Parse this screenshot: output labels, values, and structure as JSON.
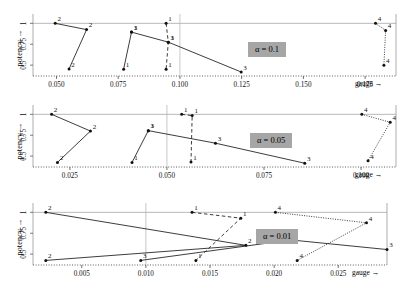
{
  "figure": {
    "y_axis_label": "potency →",
    "x_axis_label": "gauge →",
    "y_ticks": [
      "0.5",
      "0.75",
      "1"
    ],
    "y_tick_values": [
      0.5,
      0.75,
      1.0
    ],
    "ylim": [
      0.37,
      1.04
    ],
    "point_label_series": [
      "1",
      "2",
      "3",
      "4"
    ]
  },
  "panels": [
    {
      "id": "panel-alpha-0-1",
      "alpha_label": "α = 0.1",
      "x_ticks": [
        "0.050",
        "0.075",
        "0.100",
        "0.125",
        "0.150",
        "0.175"
      ],
      "x_tick_values": [
        0.05,
        0.075,
        0.1,
        0.125,
        0.15,
        0.175
      ],
      "xlim": [
        0.0405,
        0.1875
      ],
      "vline": 0.1,
      "chart_data": {
        "type": "line",
        "title": "α = 0.1",
        "xlabel": "gauge →",
        "ylabel": "potency →",
        "ylim": [
          0.37,
          1.04
        ],
        "xlim": [
          0.0405,
          0.1875
        ],
        "grid": false,
        "legend": "none",
        "series": [
          {
            "name": "group-2-left",
            "label": "2",
            "style": "solid",
            "points": [
              {
                "x": 0.0495,
                "y": 1.0,
                "label": "2"
              },
              {
                "x": 0.0622,
                "y": 0.925,
                "label": "2"
              },
              {
                "x": 0.0551,
                "y": 0.455,
                "label": "2"
              }
            ]
          },
          {
            "name": "group-1-mid",
            "label": "1",
            "style": "solid",
            "points": [
              {
                "x": 0.0804,
                "y": 0.895,
                "label": "1"
              },
              {
                "x": 0.0772,
                "y": 0.452,
                "label": "1"
              }
            ]
          },
          {
            "name": "group-3-mid",
            "label": "3",
            "style": "solid",
            "points": [
              {
                "x": 0.0804,
                "y": 0.895,
                "label": "3"
              },
              {
                "x": 0.0953,
                "y": 0.775,
                "label": "3"
              },
              {
                "x": 0.1248,
                "y": 0.418,
                "label": "3"
              }
            ]
          },
          {
            "name": "group-1-dashed",
            "label": "1",
            "style": "dashed",
            "points": [
              {
                "x": 0.0944,
                "y": 1.0,
                "label": "1"
              },
              {
                "x": 0.0953,
                "y": 0.775,
                "label": "1"
              },
              {
                "x": 0.0944,
                "y": 0.452,
                "label": "1"
              }
            ]
          },
          {
            "name": "group-4-right",
            "label": "4",
            "style": "dotted",
            "points": [
              {
                "x": 0.1792,
                "y": 1.0,
                "label": "4"
              },
              {
                "x": 0.1833,
                "y": 0.915,
                "label": "4"
              },
              {
                "x": 0.1826,
                "y": 0.5,
                "label": "4"
              }
            ]
          }
        ]
      }
    },
    {
      "id": "panel-alpha-0-05",
      "alpha_label": "α = 0.05",
      "x_ticks": [
        "0.025",
        "0.050",
        "0.075",
        "0.100"
      ],
      "x_tick_values": [
        0.025,
        0.05,
        0.075,
        0.1
      ],
      "xlim": [
        0.0155,
        0.109
      ],
      "vline": 0.05,
      "chart_data": {
        "type": "line",
        "title": "α = 0.05",
        "xlabel": "gauge →",
        "ylabel": "potency →",
        "ylim": [
          0.37,
          1.04
        ],
        "xlim": [
          0.0155,
          0.109
        ],
        "grid": false,
        "legend": "none",
        "series": [
          {
            "name": "group-2-left",
            "label": "2",
            "style": "solid",
            "points": [
              {
                "x": 0.0203,
                "y": 1.0,
                "label": "2"
              },
              {
                "x": 0.0303,
                "y": 0.8,
                "label": "2"
              },
              {
                "x": 0.0218,
                "y": 0.425,
                "label": "2"
              }
            ]
          },
          {
            "name": "group-1-mid",
            "label": "1",
            "style": "solid",
            "points": [
              {
                "x": 0.0452,
                "y": 0.805,
                "label": "1"
              },
              {
                "x": 0.041,
                "y": 0.425,
                "label": "1"
              }
            ]
          },
          {
            "name": "group-3-mid",
            "label": "3",
            "style": "solid",
            "points": [
              {
                "x": 0.0452,
                "y": 0.805,
                "label": "3"
              },
              {
                "x": 0.0625,
                "y": 0.655,
                "label": "3"
              },
              {
                "x": 0.0855,
                "y": 0.415,
                "label": "3"
              }
            ]
          },
          {
            "name": "group-1-dashed",
            "label": "1",
            "style": "dashed",
            "points": [
              {
                "x": 0.0538,
                "y": 1.0,
                "label": "1"
              },
              {
                "x": 0.0565,
                "y": 0.985,
                "label": "1"
              },
              {
                "x": 0.0562,
                "y": 0.43,
                "label": "1"
              }
            ]
          },
          {
            "name": "group-4-right",
            "label": "4",
            "style": "dotted",
            "points": [
              {
                "x": 0.1002,
                "y": 1.0,
                "label": "4"
              },
              {
                "x": 0.1075,
                "y": 0.905,
                "label": "4"
              },
              {
                "x": 0.1018,
                "y": 0.445,
                "label": "4"
              }
            ]
          }
        ]
      }
    },
    {
      "id": "panel-alpha-0-01",
      "alpha_label": "α = 0.01",
      "x_ticks": [
        "0.005",
        "0.010",
        "0.015",
        "0.020",
        "0.025"
      ],
      "x_tick_values": [
        0.005,
        0.01,
        0.015,
        0.02,
        0.025
      ],
      "xlim": [
        0.0012,
        0.0288
      ],
      "vline": 0.01,
      "chart_data": {
        "type": "line",
        "title": "α = 0.01",
        "xlabel": "gauge →",
        "ylabel": "potency →",
        "ylim": [
          0.37,
          1.04
        ],
        "xlim": [
          0.0012,
          0.0288
        ],
        "grid": false,
        "legend": "none",
        "series": [
          {
            "name": "group-2-left",
            "label": "2",
            "style": "solid",
            "points": [
              {
                "x": 0.0022,
                "y": 1.0,
                "label": "2"
              },
              {
                "x": 0.0178,
                "y": 0.605,
                "label": "2"
              },
              {
                "x": 0.0022,
                "y": 0.425,
                "label": "2"
              }
            ]
          },
          {
            "name": "group-3-mid",
            "label": "3",
            "style": "solid",
            "points": [
              {
                "x": 0.0096,
                "y": 0.425,
                "label": "3"
              },
              {
                "x": 0.0213,
                "y": 0.67,
                "label": "3"
              },
              {
                "x": 0.0288,
                "y": 0.555,
                "label": "3"
              }
            ]
          },
          {
            "name": "group-1-dashed",
            "label": "1",
            "style": "dashed",
            "points": [
              {
                "x": 0.0136,
                "y": 1.0,
                "label": "1"
              },
              {
                "x": 0.0174,
                "y": 0.93,
                "label": "1"
              },
              {
                "x": 0.0139,
                "y": 0.425,
                "label": "1"
              }
            ]
          },
          {
            "name": "group-4-right",
            "label": "4",
            "style": "dotted",
            "points": [
              {
                "x": 0.0201,
                "y": 1.0,
                "label": "4"
              },
              {
                "x": 0.0272,
                "y": 0.875,
                "label": "4"
              },
              {
                "x": 0.0218,
                "y": 0.425,
                "label": "4"
              }
            ]
          }
        ]
      }
    }
  ]
}
